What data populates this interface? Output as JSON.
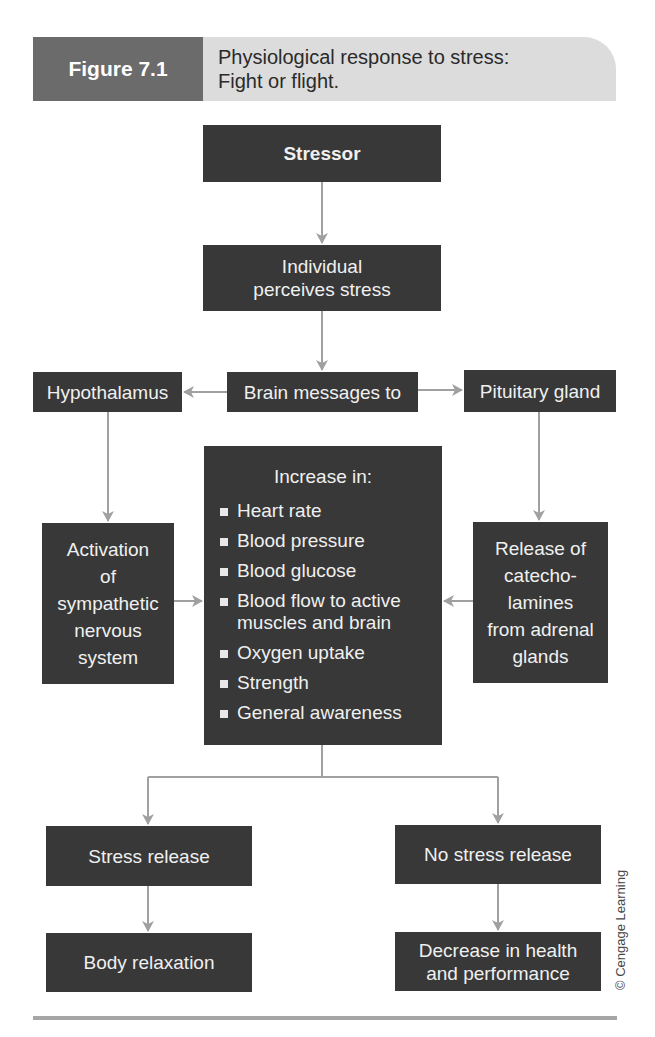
{
  "header": {
    "figure_label": "Figure 7.1",
    "title_line1": "Physiological response to stress:",
    "title_line2": "Fight or flight."
  },
  "nodes": {
    "stressor": "Stressor",
    "perceives": [
      "Individual",
      "perceives stress"
    ],
    "brain_messages": "Brain messages to",
    "hypothalamus": "Hypothalamus",
    "pituitary": "Pituitary gland",
    "activation": [
      "Activation",
      "of",
      "sympathetic",
      "nervous",
      "system"
    ],
    "release": [
      "Release of",
      "catecho-",
      "lamines",
      "from adrenal",
      "glands"
    ],
    "increase": {
      "title": "Increase in:",
      "items": [
        "Heart rate",
        "Blood pressure",
        "Blood glucose",
        "Blood flow to active muscles and brain",
        "Oxygen uptake",
        "Strength",
        "General awareness"
      ]
    },
    "stress_release": "Stress release",
    "no_stress_release": "No stress release",
    "body_relaxation": "Body relaxation",
    "decrease": [
      "Decrease in health",
      "and performance"
    ]
  },
  "credit": "© Cengage Learning",
  "colors": {
    "box_fill": "#383838",
    "box_text": "#f0f0f0",
    "figure_tab": "#6b6b6b",
    "title_band": "#dcdcdc",
    "arrow": "#a0a0a0"
  }
}
